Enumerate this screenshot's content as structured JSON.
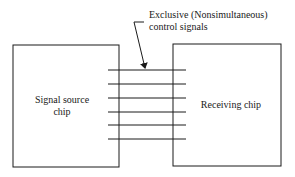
{
  "annotation": {
    "line1": "Exclusive (Nonsimultaneous)",
    "line2": "control signals"
  },
  "source_chip": {
    "label_line1": "Signal source",
    "label_line2": "chip"
  },
  "receiving_chip": {
    "label": "Receiving chip"
  },
  "signal_lines": {
    "count": 6
  },
  "colors": {
    "stroke": "#1a1a1a",
    "background": "#ffffff"
  }
}
